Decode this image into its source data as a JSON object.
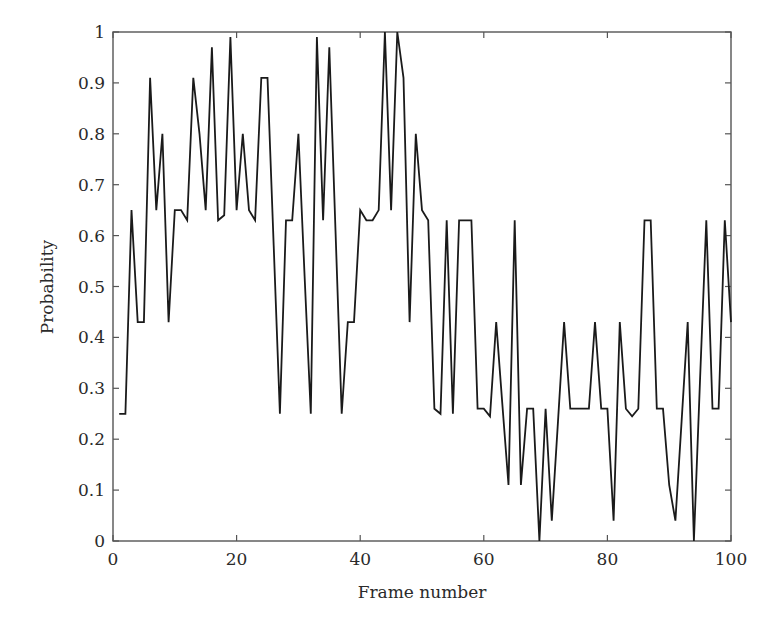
{
  "chart_data": {
    "type": "line",
    "title": "",
    "xlabel": "Frame number",
    "ylabel": "Probability",
    "xlim": [
      0,
      100
    ],
    "ylim": [
      0,
      1
    ],
    "grid": false,
    "legend": null,
    "x_ticks": [
      0,
      20,
      40,
      60,
      80,
      100
    ],
    "x_tick_labels": [
      "0",
      "20",
      "40",
      "60",
      "80",
      "100"
    ],
    "y_ticks": [
      0,
      0.1,
      0.2,
      0.3,
      0.4,
      0.5,
      0.6,
      0.7,
      0.8,
      0.9,
      1
    ],
    "y_tick_labels": [
      "0",
      "0.1",
      "0.2",
      "0.3",
      "0.4",
      "0.5",
      "0.6",
      "0.7",
      "0.8",
      "0.9",
      "1"
    ],
    "series": [
      {
        "name": "Probability",
        "color": "#1a1a1a",
        "x": [
          1,
          2,
          3,
          4,
          5,
          6,
          7,
          8,
          9,
          10,
          11,
          12,
          13,
          14,
          15,
          16,
          17,
          18,
          19,
          20,
          21,
          22,
          23,
          24,
          25,
          26,
          27,
          28,
          29,
          30,
          31,
          32,
          33,
          34,
          35,
          36,
          37,
          38,
          39,
          40,
          41,
          42,
          43,
          44,
          45,
          46,
          47,
          48,
          49,
          50,
          51,
          52,
          53,
          54,
          55,
          56,
          57,
          58,
          59,
          60,
          61,
          62,
          63,
          64,
          65,
          66,
          67,
          68,
          69,
          70,
          71,
          72,
          73,
          74,
          75,
          76,
          77,
          78,
          79,
          80,
          81,
          82,
          83,
          84,
          85,
          86,
          87,
          88,
          89,
          90,
          91,
          92,
          93,
          94,
          95,
          96,
          97,
          98,
          99,
          100
        ],
        "values": [
          0.25,
          0.25,
          0.65,
          0.43,
          0.43,
          0.91,
          0.65,
          0.8,
          0.43,
          0.65,
          0.65,
          0.63,
          0.91,
          0.8,
          0.65,
          0.97,
          0.63,
          0.64,
          0.99,
          0.65,
          0.8,
          0.65,
          0.63,
          0.91,
          0.91,
          0.58,
          0.25,
          0.63,
          0.63,
          0.8,
          0.52,
          0.25,
          0.99,
          0.63,
          0.97,
          0.61,
          0.25,
          0.43,
          0.43,
          0.65,
          0.63,
          0.63,
          0.65,
          1.0,
          0.65,
          1.0,
          0.91,
          0.43,
          0.8,
          0.65,
          0.63,
          0.26,
          0.25,
          0.63,
          0.25,
          0.63,
          0.63,
          0.63,
          0.26,
          0.26,
          0.245,
          0.43,
          0.27,
          0.11,
          0.63,
          0.11,
          0.26,
          0.26,
          0.0,
          0.26,
          0.04,
          0.235,
          0.43,
          0.26,
          0.26,
          0.26,
          0.26,
          0.43,
          0.26,
          0.26,
          0.04,
          0.43,
          0.26,
          0.245,
          0.26,
          0.63,
          0.63,
          0.26,
          0.26,
          0.11,
          0.04,
          0.235,
          0.43,
          0.0,
          0.32,
          0.63,
          0.26,
          0.26,
          0.63,
          0.43
        ]
      }
    ]
  },
  "labels": {
    "xlabel": "Frame number",
    "ylabel": "Probability"
  }
}
